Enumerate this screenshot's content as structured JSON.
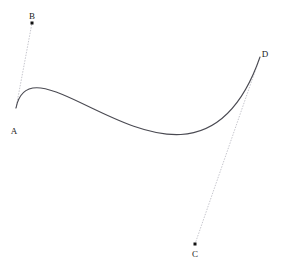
{
  "figure": {
    "type": "cubic-bezier-diagram",
    "width": 281,
    "height": 266,
    "background_color": "#ffffff",
    "curve_color": "#4a4a52",
    "curve_width": 1.1,
    "guide_color": "#b8b8c0",
    "guide_width": 0.8,
    "guide_dash": "0.7 2.1",
    "point_color": "#111111",
    "point_radius": 1.5,
    "label_color": "#1a1a1a",
    "label_font_size": 9
  },
  "chart_data": {
    "type": "line",
    "title": "",
    "xlabel": "",
    "ylabel": "",
    "grid": false,
    "legend": "none",
    "xlim": [
      0,
      281
    ],
    "ylim": [
      266,
      0
    ],
    "curve": {
      "kind": "cubic-bezier",
      "start": "A",
      "control1": "B",
      "control2": "C",
      "end": "D",
      "path": "M 16 108 C 32 23 195 244 260 57",
      "sampled_points": [
        [
          16,
          108
        ],
        [
          24.3,
          94.9
        ],
        [
          33.2,
          92.0
        ],
        [
          42.5,
          95.2
        ],
        [
          52.1,
          102.0
        ],
        [
          62.0,
          110.5
        ],
        [
          72.1,
          119.2
        ],
        [
          82.3,
          127.0
        ],
        [
          92.7,
          133.2
        ],
        [
          103.1,
          137.6
        ],
        [
          113.6,
          140.1
        ],
        [
          124.1,
          140.8
        ],
        [
          134.7,
          139.8
        ],
        [
          145.2,
          137.2
        ],
        [
          155.8,
          133.1
        ],
        [
          166.4,
          127.5
        ],
        [
          177.0,
          120.4
        ],
        [
          187.7,
          111.6
        ],
        [
          198.5,
          101.1
        ],
        [
          209.4,
          88.8
        ],
        [
          220.5,
          74.8
        ],
        [
          231.9,
          58.9
        ],
        [
          243.6,
          41.2
        ],
        [
          251.6,
          48.0
        ],
        [
          260,
          57
        ]
      ],
      "extrema": {
        "local_max_point": [
          37,
          93
        ],
        "local_min_point": [
          167,
          134
        ]
      }
    },
    "control_polygon_guides": [
      {
        "name": "A-B",
        "from": "A",
        "to": "B",
        "style": "dotted"
      },
      {
        "name": "C-D",
        "from": "C",
        "to": "D",
        "style": "dotted"
      }
    ],
    "points": [
      {
        "id": "A",
        "label": "A",
        "role": "start-anchor",
        "x": 16,
        "y": 108,
        "marker": false,
        "label_x": 14,
        "label_y": 127
      },
      {
        "id": "B",
        "label": "B",
        "role": "control-point-1",
        "x": 32,
        "y": 23,
        "marker": true,
        "label_x": 32,
        "label_y": 12
      },
      {
        "id": "C",
        "label": "C",
        "role": "control-point-2",
        "x": 195,
        "y": 244,
        "marker": true,
        "label_x": 195,
        "label_y": 250
      },
      {
        "id": "D",
        "label": "D",
        "role": "end-anchor",
        "x": 260,
        "y": 57,
        "marker": false,
        "label_x": 265,
        "label_y": 50
      }
    ]
  }
}
